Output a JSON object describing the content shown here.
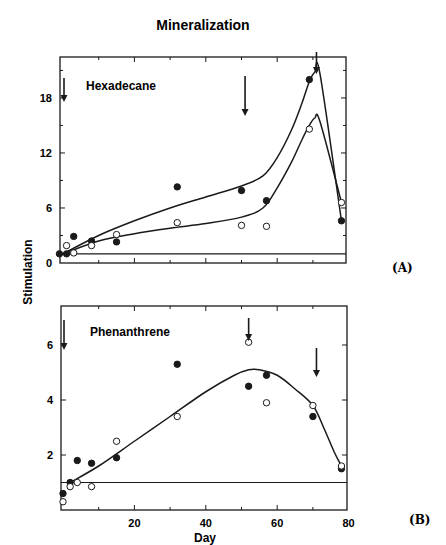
{
  "chart_data": {
    "type": "scatter",
    "title": "Mineralization",
    "ylabel": "Stimulation",
    "xlabel": "Day",
    "panels": [
      {
        "id": "A",
        "tag": "(A)",
        "label": "Hexadecane",
        "xlim": [
          0,
          80
        ],
        "ylim": [
          0,
          22
        ],
        "yticks": [
          0,
          6,
          12,
          18
        ],
        "yminor": [
          3,
          9,
          15,
          21
        ],
        "xticks": [
          0,
          10,
          20,
          30,
          40,
          50,
          60,
          70,
          80
        ],
        "baseline": 1,
        "series": [
          {
            "name": "filled",
            "marker": "filled-circle",
            "x": [
              -1,
              1,
              3,
              8,
              15,
              32,
              50,
              57,
              69,
              78
            ],
            "y": [
              1.0,
              1.0,
              2.9,
              2.4,
              2.3,
              8.3,
              7.9,
              6.8,
              20.0,
              4.6
            ]
          },
          {
            "name": "open",
            "marker": "open-circle",
            "x": [
              1,
              3,
              8,
              15,
              32,
              50,
              57,
              69,
              78
            ],
            "y": [
              1.9,
              1.1,
              1.9,
              3.1,
              4.4,
              4.1,
              4.0,
              14.6,
              6.6
            ]
          }
        ],
        "curves": [
          {
            "name": "upper-fit",
            "x": [
              0,
              10,
              20,
              30,
              40,
              50,
              56,
              60,
              64,
              67,
              69,
              70.5,
              72,
              78
            ],
            "y": [
              1.0,
              3.0,
              4.6,
              6.0,
              7.2,
              8.4,
              9.5,
              11.5,
              14.5,
              17.5,
              19.8,
              20.8,
              20.6,
              4.6
            ]
          },
          {
            "name": "lower-fit",
            "x": [
              0,
              10,
              20,
              30,
              40,
              50,
              56,
              60,
              64,
              67,
              69,
              70.5,
              72,
              78
            ],
            "y": [
              1.0,
              2.4,
              3.2,
              3.8,
              4.3,
              5.0,
              6.0,
              8.2,
              11.0,
              13.5,
              15.0,
              15.8,
              15.4,
              6.6
            ]
          }
        ],
        "arrows_day": [
          0,
          51,
          71
        ]
      },
      {
        "id": "B",
        "tag": "(B)",
        "label": "Phenanthrene",
        "xlim": [
          0,
          80
        ],
        "ylim": [
          0,
          7.2
        ],
        "yticks": [
          2,
          4,
          6
        ],
        "xticks": [
          0,
          10,
          20,
          30,
          40,
          50,
          60,
          70,
          80
        ],
        "xticklabels": [
          "20",
          "40",
          "60",
          "80"
        ],
        "baseline": 1,
        "series": [
          {
            "name": "filled",
            "marker": "filled-circle",
            "x": [
              0,
              2,
              4,
              8,
              15,
              32,
              52,
              57,
              70,
              78
            ],
            "y": [
              0.6,
              1.0,
              1.8,
              1.7,
              1.9,
              5.3,
              4.5,
              4.9,
              3.4,
              1.5
            ]
          },
          {
            "name": "open",
            "marker": "open-circle",
            "x": [
              0,
              2,
              4,
              8,
              15,
              32,
              52,
              57,
              70,
              78
            ],
            "y": [
              0.3,
              0.85,
              1.0,
              0.85,
              2.5,
              3.4,
              6.1,
              3.9,
              3.8,
              1.6
            ]
          }
        ],
        "curves": [
          {
            "name": "fit",
            "x": [
              2,
              10,
              20,
              30,
              40,
              48,
              52,
              55,
              60,
              65,
              70,
              73,
              76,
              78
            ],
            "y": [
              1.0,
              1.6,
              2.5,
              3.4,
              4.3,
              4.9,
              5.1,
              5.1,
              4.9,
              4.4,
              3.8,
              3.0,
              2.1,
              1.6
            ]
          }
        ],
        "arrows_day": [
          0,
          52,
          71
        ]
      }
    ]
  }
}
